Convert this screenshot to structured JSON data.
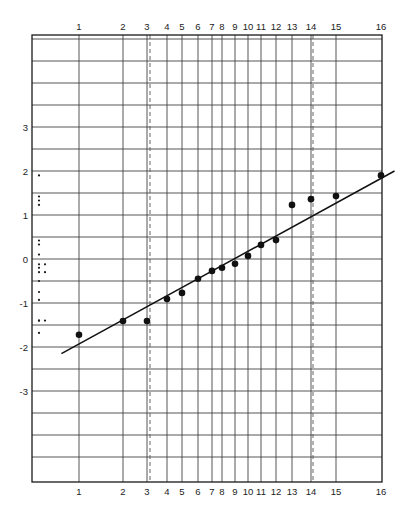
{
  "chart_data": {
    "type": "scatter",
    "title": "",
    "xlabel": "",
    "ylabel": "",
    "x_tick_labels": [
      "1",
      "2",
      "3",
      "4",
      "5",
      "6",
      "7",
      "8",
      "9",
      "10",
      "11",
      "12",
      "13",
      "14",
      "15",
      "16"
    ],
    "y_tick_labels": [
      "3",
      "2",
      "1",
      "0",
      "-1",
      "-2",
      "-3"
    ],
    "y_ticks": [
      3,
      2,
      1,
      0,
      -1,
      -2,
      -3
    ],
    "ylim": [
      -4.95,
      5.2
    ],
    "grid": true,
    "legend": null,
    "series": [
      {
        "name": "ranked observations",
        "marker": "filled-circle",
        "x": [
          1,
          2,
          3,
          4,
          5,
          6,
          7,
          8,
          9,
          10,
          11,
          12,
          13,
          14,
          15,
          16
        ],
        "values": [
          -1.72,
          -1.41,
          -1.41,
          -0.91,
          -0.77,
          -0.45,
          -0.27,
          -0.2,
          -0.11,
          0.07,
          0.32,
          0.43,
          1.23,
          1.36,
          1.43,
          1.9
        ]
      }
    ],
    "fit_line": {
      "x_start": 0.6,
      "y_start": -2.15,
      "x_end": 16.3,
      "y_end": 2.0
    },
    "dashed_reference_lines_x": [
      3,
      14
    ],
    "marginal_dot_plot": {
      "description": "small dots along left margin showing distribution of values",
      "values": [
        1.9,
        1.42,
        1.33,
        1.23,
        0.42,
        0.33,
        0.1,
        -0.12,
        -0.2,
        -0.3,
        -0.5,
        -0.75,
        -0.93,
        -1.4,
        -1.4,
        -1.68
      ],
      "second_column_values": [
        -0.12,
        -0.3,
        -1.4
      ]
    }
  },
  "layout": {
    "frame": {
      "left": 32,
      "right": 382,
      "top": 35,
      "bottom": 482
    },
    "x_positions": [
      79,
      123,
      147,
      167,
      182,
      198,
      212,
      222,
      235,
      248,
      261,
      276,
      292,
      311,
      336,
      381
    ],
    "dashed_x_px": [
      150,
      313
    ],
    "y_zero_px": 259,
    "px_per_unit": 44,
    "colors": {
      "ink": "#1a1a1a",
      "grid": "#444444",
      "background": "#ffffff"
    }
  }
}
